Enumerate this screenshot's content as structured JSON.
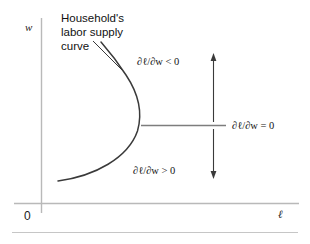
{
  "figure": {
    "type": "diagram",
    "title": "Household's labor supply curve",
    "axes": {
      "y_label": "w",
      "x_label": "ℓ",
      "origin_label": "0"
    },
    "callout": {
      "line1": "Household's",
      "line2": "labor supply",
      "line3": "curve"
    },
    "annotations": {
      "upper": "∂ℓ/∂w < 0",
      "middle": "∂ℓ/∂w = 0",
      "lower": "∂ℓ/∂w > 0"
    },
    "colors": {
      "curve": "#3a3a3a",
      "axis": "#b9b9b9",
      "text": "#111111",
      "rule": "#c6c6c6"
    }
  }
}
